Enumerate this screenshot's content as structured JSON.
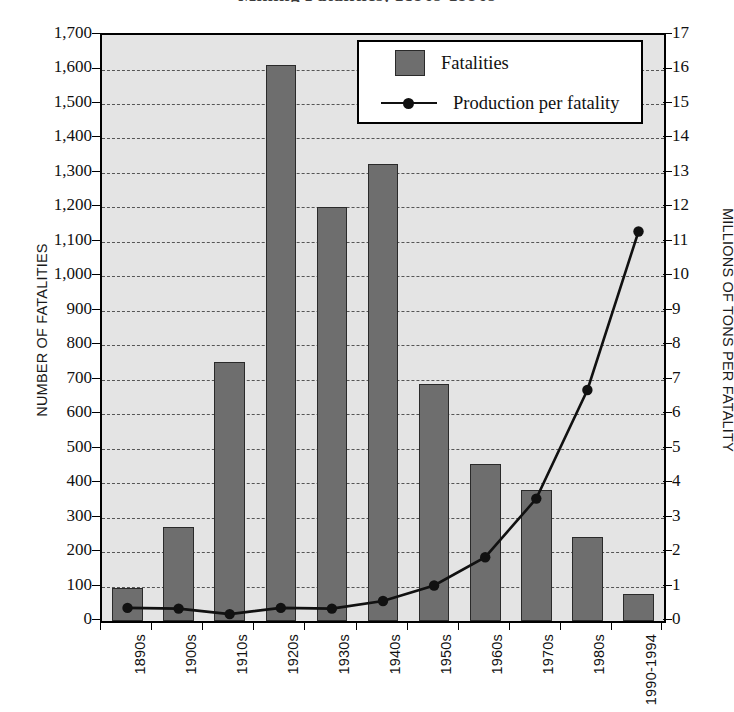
{
  "chart_data": {
    "type": "bar",
    "title": "Mining Fatalities, 1890s-1990s",
    "categories": [
      "1890s",
      "1900s",
      "1910s",
      "1920s",
      "1930s",
      "1940s",
      "1950s",
      "1960s",
      "1970s",
      "1980s",
      "1990-1994"
    ],
    "series": [
      {
        "name": "Fatalities",
        "type": "bar",
        "axis": "left",
        "values": [
          95,
          273,
          752,
          1612,
          1200,
          1327,
          688,
          455,
          380,
          245,
          78
        ]
      },
      {
        "name": "Production per fatality",
        "type": "line",
        "axis": "right",
        "values": [
          0.38,
          0.36,
          0.2,
          0.38,
          0.36,
          0.58,
          1.03,
          1.85,
          3.55,
          6.7,
          11.3
        ]
      }
    ],
    "xlabel": "",
    "ylabel": "NUMBER OF FATALITIES",
    "y2label": "MILLIONS OF TONS PER FATALITY",
    "ylim": [
      0,
      1700
    ],
    "y2lim": [
      0,
      17
    ],
    "ytick_labels": [
      "0",
      "100",
      "200",
      "300",
      "400",
      "500",
      "600",
      "700",
      "800",
      "900",
      "1,000",
      "1,100",
      "1,200",
      "1,300",
      "1,400",
      "1,500",
      "1,600",
      "1,700"
    ],
    "y2tick_labels": [
      "0",
      "1",
      "2",
      "3",
      "4",
      "5",
      "6",
      "7",
      "8",
      "9",
      "10",
      "11",
      "12",
      "13",
      "14",
      "15",
      "16",
      "17"
    ],
    "grid": true,
    "legend_position": "top-right",
    "legend": [
      "Fatalities",
      "Production per fatality"
    ],
    "colors": {
      "bar_fill": "#6e6e6e",
      "bar_border": "#2a2a2a",
      "line": "#111111",
      "plot_background": "#e4e4e4",
      "grid": "#555555",
      "axis": "#000000",
      "legend_background": "#ffffff"
    }
  }
}
